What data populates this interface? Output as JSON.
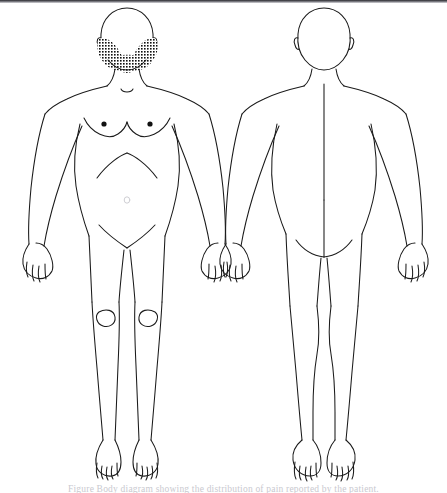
{
  "document": {
    "type": "clinical-body-diagram",
    "title": "Anterior and posterior body diagram",
    "background_color": "#ffffff",
    "line_color": "#1a1a1a",
    "shading_color": "#111111",
    "top_rule_color": "#2b2b2f"
  },
  "caption": {
    "visible": true,
    "clipped": true,
    "text": "Figure  Body diagram showing the distribution of pain reported by the patient.",
    "color": "#c9c9cf"
  },
  "figures": [
    {
      "id": "anterior",
      "name": "front-view-figure",
      "view_label": "Anterior (front) view",
      "position": "left",
      "sex_presentation": "female",
      "features": [
        "head-outline",
        "ears",
        "neck",
        "clavicles",
        "suprasternal-notch",
        "breasts",
        "nipples",
        "costal-margin",
        "navel",
        "inguinal-creases",
        "arms-abducted",
        "hands-with-fingers",
        "patellae",
        "legs",
        "feet-with-toes"
      ],
      "shaded_regions": [
        {
          "name": "left-cheek-jaw-stipple",
          "region_label": "Left cheek and jaw",
          "pattern": "stipple-grid",
          "side": "left"
        },
        {
          "name": "right-cheek-jaw-stipple",
          "region_label": "Right cheek and jaw",
          "pattern": "stipple-grid",
          "side": "right"
        }
      ]
    },
    {
      "id": "posterior",
      "name": "back-view-figure",
      "view_label": "Posterior (back) view",
      "position": "right",
      "sex_presentation": "female",
      "features": [
        "head-outline",
        "ears",
        "neck",
        "shoulders",
        "spine-midline",
        "gluteal-folds",
        "natal-cleft",
        "arms-abducted",
        "hands-with-fingers",
        "calves",
        "heels",
        "feet-with-toes"
      ],
      "shaded_regions": []
    }
  ]
}
